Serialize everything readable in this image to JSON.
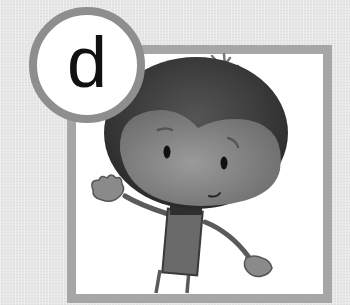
{
  "badge": {
    "letter": "d"
  },
  "illustration": {
    "subject": "cartoon character waving",
    "icons": [
      "sparkle-icon"
    ]
  },
  "colors": {
    "background": "#e6e6e6",
    "frame_border": "#a6a6a6",
    "badge_ring": "#8e8e8e",
    "letter": "#111111"
  }
}
